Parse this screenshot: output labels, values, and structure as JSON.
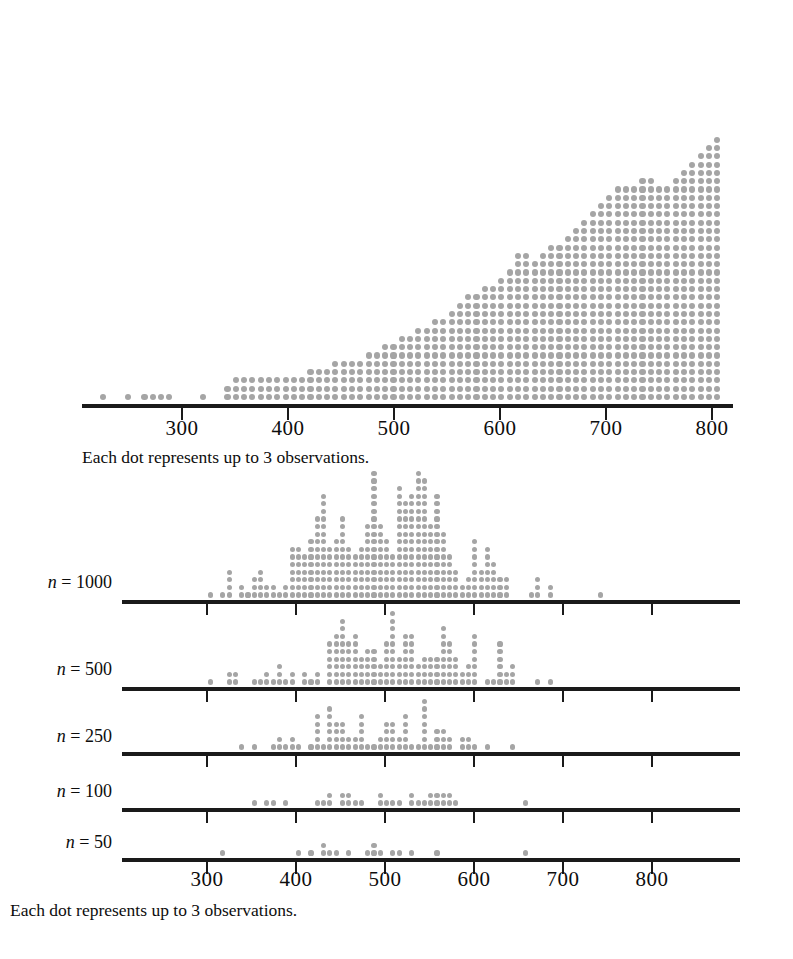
{
  "figure": {
    "title": "",
    "dot_color": "#a5a5a5",
    "axis_color": "#1a1a1a",
    "background": "#ffffff"
  },
  "top_panel": {
    "caption": "Each dot represents up to 3 observations.",
    "axis": {
      "x_min_px": 82,
      "x_max_px": 733,
      "y_px": 404,
      "px_per_unit": 1.062,
      "value_at_left_px": 300,
      "left_tick_px": 182,
      "tick_values": [
        300,
        400,
        500,
        600,
        700,
        800
      ],
      "tick_labels": [
        "300",
        "400",
        "500",
        "600",
        "700",
        "800"
      ],
      "tick_px": [
        182,
        288,
        394,
        500,
        606,
        712
      ],
      "tick_label_y_px": 418
    },
    "dot_size_px": 6.2,
    "dot_step_x_px": 8.3,
    "dot_step_y_px": 8.3,
    "first_row_y_px": 397
  },
  "bottom_panels": {
    "caption": "Each dot represents up to 3 observations.",
    "axis": {
      "x_min_px": 122,
      "x_max_px": 740,
      "px_per_unit": 0.89,
      "tick_values": [
        300,
        400,
        500,
        600,
        700,
        800
      ],
      "tick_labels": [
        "300",
        "400",
        "500",
        "600",
        "700",
        "800"
      ],
      "tick_px": [
        207,
        296,
        385,
        474,
        563,
        652
      ],
      "tick_label_y_px": 869
    },
    "rows": [
      {
        "label_prefix": "n",
        "label_eq": "=",
        "label_value": "1000",
        "n": 1000,
        "baseline_y_px": 600,
        "label_y_px": 572,
        "label_right_px": 112
      },
      {
        "label_prefix": "n",
        "label_eq": "=",
        "label_value": "500",
        "n": 500,
        "baseline_y_px": 687,
        "label_y_px": 659,
        "label_right_px": 112
      },
      {
        "label_prefix": "n",
        "label_eq": "=",
        "label_value": "250",
        "n": 250,
        "baseline_y_px": 752,
        "label_y_px": 726,
        "label_right_px": 112
      },
      {
        "label_prefix": "n",
        "label_eq": "=",
        "label_value": "100",
        "n": 100,
        "baseline_y_px": 808,
        "label_y_px": 781,
        "label_right_px": 112
      },
      {
        "label_prefix": "n",
        "label_eq": "=",
        "label_value": "50",
        "n": 50,
        "baseline_y_px": 858,
        "label_y_px": 832,
        "label_right_px": 112
      }
    ]
  },
  "chart_data": {
    "type": "dotplot",
    "title": "",
    "xlabel": "",
    "ylabel": "",
    "xlim": [
      215,
      825
    ],
    "grid": false,
    "legend": null,
    "dot_value": 3,
    "annotation": "Each dot represents up to 3 observations.",
    "panels": [
      {
        "name": "full-sample",
        "n_label": "",
        "bin_width": 7.8,
        "bin_start": 218,
        "counts": [
          1,
          0,
          0,
          1,
          0,
          1,
          1,
          1,
          1,
          0,
          0,
          0,
          1,
          0,
          0,
          2,
          3,
          3,
          3,
          3,
          3,
          3,
          3,
          3,
          3,
          4,
          4,
          4,
          5,
          5,
          5,
          5,
          6,
          6,
          7,
          7,
          8,
          8,
          9,
          9,
          10,
          10,
          11,
          12,
          13,
          13,
          14,
          14,
          15,
          16,
          18,
          18,
          17,
          18,
          19,
          19,
          20,
          21,
          22,
          23,
          24,
          25,
          26,
          26,
          26,
          27,
          27,
          26,
          26,
          27,
          28,
          29,
          30,
          31,
          32,
          33,
          34,
          35,
          36,
          37,
          38,
          39,
          40,
          41,
          42,
          43,
          44,
          43,
          42,
          41,
          40,
          39,
          38,
          37,
          36,
          35,
          34,
          33,
          32,
          31,
          30,
          29,
          28,
          27,
          26,
          25,
          24,
          23,
          22,
          21,
          20,
          19,
          18,
          17,
          16,
          15,
          14,
          13,
          12,
          11,
          10,
          9,
          8,
          7,
          6,
          5,
          4,
          3,
          2,
          2,
          1,
          1,
          1,
          0,
          1,
          1,
          1,
          0,
          0,
          1,
          1
        ]
      },
      {
        "name": "n-1000",
        "n": 1000,
        "bin_width": 6.5,
        "counts": [
          1,
          1,
          2,
          2,
          2,
          2,
          2,
          3,
          3,
          3,
          4,
          4,
          4,
          5,
          5,
          5,
          6,
          6,
          7,
          7,
          8,
          8,
          9,
          9,
          10,
          10,
          11,
          11,
          12,
          12,
          12,
          12,
          11,
          11,
          10,
          10,
          9,
          9,
          8,
          8,
          7,
          7,
          6,
          6,
          5,
          5,
          4,
          4,
          3,
          3,
          2,
          2,
          1,
          1,
          1
        ]
      },
      {
        "name": "n-500",
        "n": 500,
        "bin_width": 6.5,
        "counts": [
          1,
          0,
          1,
          1,
          2,
          2,
          2,
          3,
          3,
          4,
          4,
          5,
          5,
          6,
          6,
          6,
          5,
          5,
          4,
          4,
          3,
          3,
          2,
          2,
          1,
          1,
          1
        ]
      },
      {
        "name": "n-250",
        "n": 250,
        "bin_width": 6.5,
        "counts": [
          1,
          1,
          1,
          1,
          2,
          2,
          2,
          3,
          3,
          3,
          2,
          2,
          2,
          1,
          1,
          1,
          1
        ]
      },
      {
        "name": "n-100",
        "n": 100,
        "bin_width": 6.5,
        "counts": [
          1,
          1,
          1,
          1,
          1,
          1,
          2,
          1,
          2,
          1,
          1,
          1,
          1
        ]
      },
      {
        "name": "n-50",
        "n": 50,
        "bin_width": 6.5,
        "counts": [
          1,
          1,
          1,
          1,
          2,
          1,
          1,
          1,
          1
        ]
      }
    ]
  }
}
